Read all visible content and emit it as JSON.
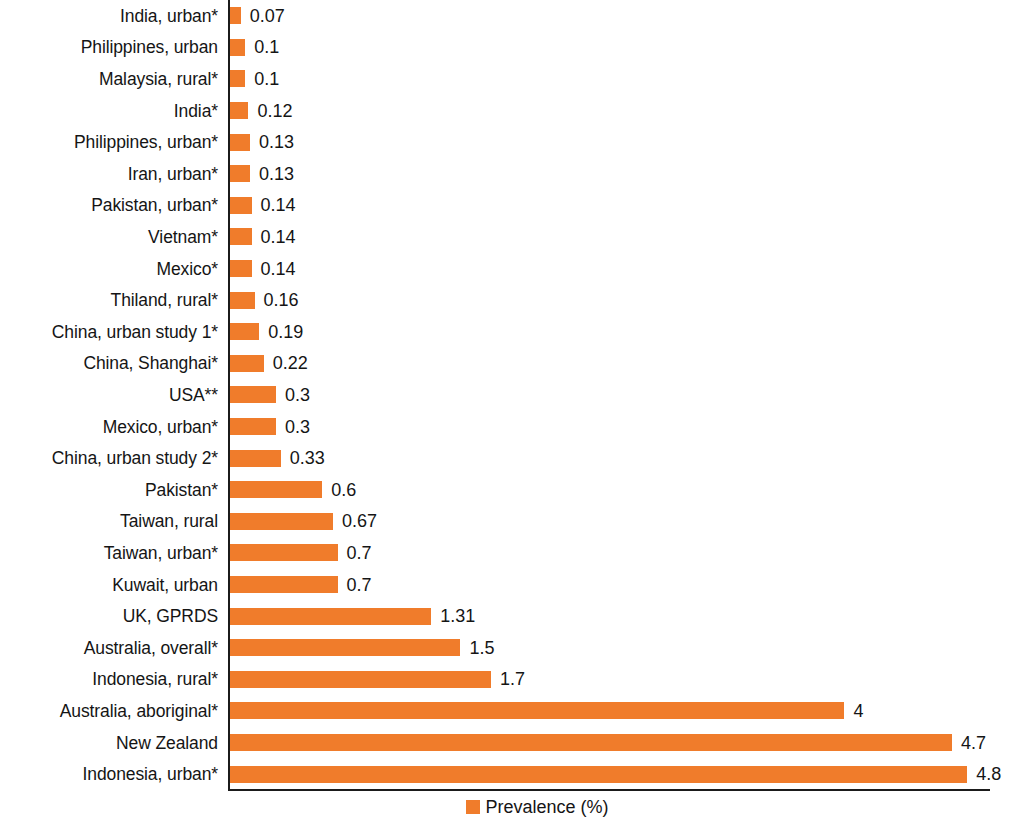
{
  "chart_data": {
    "type": "bar",
    "orientation": "horizontal",
    "title": "",
    "xlabel": "",
    "ylabel": "",
    "xlim": [
      0,
      5.0
    ],
    "grid": false,
    "legend_position": "bottom",
    "legend": [
      "Prevalence (%)"
    ],
    "series_color": "#F07C2B",
    "categories": [
      "India, urban*",
      "Philippines, urban",
      "Malaysia, rural*",
      "India*",
      "Philippines, urban*",
      "Iran, urban*",
      "Pakistan, urban*",
      "Vietnam*",
      "Mexico*",
      "Thiland, rural*",
      "China, urban study 1*",
      "China, Shanghai*",
      "USA**",
      "Mexico, urban*",
      "China, urban study 2*",
      "Pakistan*",
      "Taiwan, rural",
      "Taiwan, urban*",
      "Kuwait, urban",
      "UK, GPRDS",
      "Australia, overall*",
      "Indonesia, rural*",
      "Australia, aboriginal*",
      "New Zealand",
      "Indonesia, urban*"
    ],
    "values": [
      0.07,
      0.1,
      0.1,
      0.12,
      0.13,
      0.13,
      0.14,
      0.14,
      0.14,
      0.16,
      0.19,
      0.22,
      0.3,
      0.3,
      0.33,
      0.6,
      0.67,
      0.7,
      0.7,
      1.31,
      1.5,
      1.7,
      4,
      4.7,
      4.8
    ],
    "value_labels": [
      "0.07",
      "0.1",
      "0.1",
      "0.12",
      "0.13",
      "0.13",
      "0.14",
      "0.14",
      "0.14",
      "0.16",
      "0.19",
      "0.22",
      "0.3",
      "0.3",
      "0.33",
      "0.6",
      "0.67",
      "0.7",
      "0.7",
      "1.31",
      "1.5",
      "1.7",
      "4",
      "4.7",
      "4.8"
    ]
  },
  "legend": {
    "label": "Prevalence (%)"
  }
}
